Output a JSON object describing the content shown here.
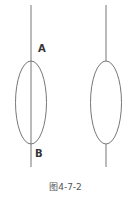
{
  "diagram": {
    "label_a": "A",
    "label_b": "B",
    "caption": "图4-7-2",
    "stroke_color": "#777777"
  }
}
